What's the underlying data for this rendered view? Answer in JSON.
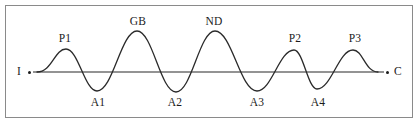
{
  "figure": {
    "title": "",
    "frame": {
      "visible": true,
      "border_color": "#8a8a8a"
    },
    "colors": {
      "curve": "#2a2a2a",
      "baseline": "#6f6f6f",
      "text": "#1b1b1b",
      "background": "#ffffff"
    },
    "axis_endpoints": {
      "start": {
        "label": "I",
        "x": 20,
        "y": 67,
        "dot_x": 29,
        "dot_y": 71
      },
      "end": {
        "label": "C",
        "x": 395,
        "y": 67,
        "dot_x": 386,
        "dot_y": 71
      }
    },
    "baseline": {
      "y": 72,
      "x_start": 33,
      "x_end": 384
    }
  },
  "chart_data": {
    "type": "line",
    "title": "",
    "xlabel": "",
    "ylabel": "",
    "grid": false,
    "legend": "none",
    "baseline_value": 0,
    "x": [
      37,
      66,
      97,
      137,
      176,
      215,
      257,
      294,
      317,
      353,
      378
    ],
    "values": [
      0,
      23,
      -19,
      41,
      -20,
      41,
      -19,
      22,
      -17,
      22,
      0
    ],
    "annotations": [
      {
        "name": "P1",
        "kind": "peak",
        "x": 66,
        "y": 49,
        "label_x": 65,
        "label_y": 33
      },
      {
        "name": "A1",
        "kind": "trough",
        "x": 97,
        "y": 91,
        "label_x": 98,
        "label_y": 97
      },
      {
        "name": "GB",
        "kind": "peak",
        "x": 137,
        "y": 31,
        "label_x": 138,
        "label_y": 16
      },
      {
        "name": "A2",
        "kind": "trough",
        "x": 176,
        "y": 92,
        "label_x": 175,
        "label_y": 97
      },
      {
        "name": "ND",
        "kind": "peak",
        "x": 215,
        "y": 31,
        "label_x": 214,
        "label_y": 16
      },
      {
        "name": "A3",
        "kind": "trough",
        "x": 257,
        "y": 91,
        "label_x": 257,
        "label_y": 97
      },
      {
        "name": "P2",
        "kind": "peak",
        "x": 294,
        "y": 50,
        "label_x": 295,
        "label_y": 33
      },
      {
        "name": "A4",
        "kind": "trough",
        "x": 317,
        "y": 89,
        "label_x": 318,
        "label_y": 97
      },
      {
        "name": "P3",
        "kind": "peak",
        "x": 353,
        "y": 50,
        "label_x": 355,
        "label_y": 33
      }
    ]
  }
}
